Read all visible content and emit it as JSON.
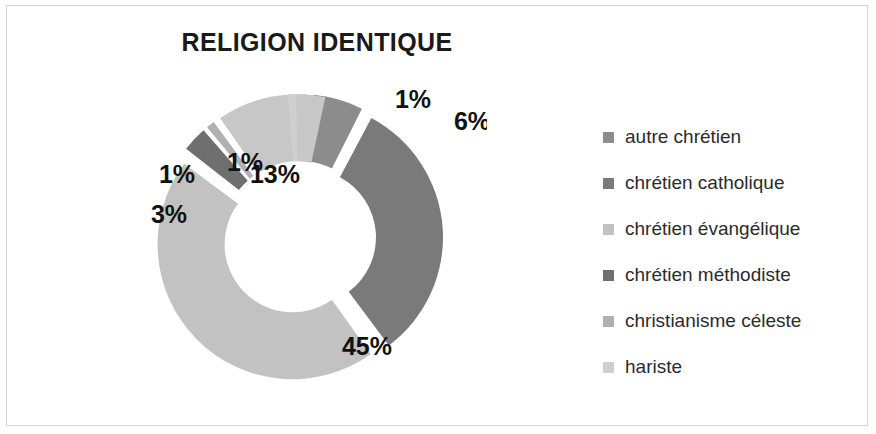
{
  "chart_title": "RELIGION IDENTIQUE",
  "legend": {
    "items": [
      {
        "label": "autre chrétien",
        "color": "#8c8c8c"
      },
      {
        "label": "chrétien catholique",
        "color": "#7a7a7a"
      },
      {
        "label": "chrétien évangélique",
        "color": "#c2c2c2"
      },
      {
        "label": "chrétien méthodiste",
        "color": "#6f6f6f"
      },
      {
        "label": "christianisme céleste",
        "color": "#b0b0b0"
      },
      {
        "label": "hariste",
        "color": "#cfcfcf"
      }
    ]
  },
  "chart_data": {
    "type": "pie",
    "variant": "doughnut-exploded",
    "title": "RELIGION IDENTIQUE",
    "xlabel": "",
    "ylabel": "",
    "legend_position": "right",
    "grid": false,
    "unit": "%",
    "categories": [
      "autre chrétien",
      "chrétien catholique",
      "chrétien évangélique",
      "chrétien méthodiste",
      "christianisme céleste",
      "hariste"
    ],
    "values": [
      6,
      32,
      45,
      3,
      1,
      1
    ],
    "data_labels": [
      "6%",
      "32%",
      "45%",
      "3%",
      "1%",
      "1%"
    ],
    "extra_slices": [
      {
        "label": "13%",
        "value": 13,
        "color": "#c7c7c7"
      },
      {
        "label": "1%",
        "value": 1,
        "color": "#cfcfcf"
      }
    ],
    "colors": [
      "#8c8c8c",
      "#7a7a7a",
      "#c2c2c2",
      "#6f6f6f",
      "#b0b0b0",
      "#cfcfcf"
    ],
    "slices": [
      {
        "label": "1%",
        "value": 1,
        "color": "#cfcfcf",
        "start": 0,
        "end": 3.6,
        "lx": 286,
        "ly": 25
      },
      {
        "label": "6%",
        "value": 6,
        "color": "#8c8c8c",
        "start": 5.0,
        "end": 26.6,
        "lx": 345,
        "ly": 47
      },
      {
        "label": "32%",
        "value": 32,
        "color": "#7a7a7a",
        "start": 28.0,
        "end": 143.2,
        "lx": 404,
        "ly": 172
      },
      {
        "label": "45%",
        "value": 45,
        "color": "#c2c2c2",
        "start": 144.6,
        "end": 306.6,
        "lx": 240,
        "ly": 272
      },
      {
        "label": "3%",
        "value": 3,
        "color": "#6f6f6f",
        "start": 308.0,
        "end": 318.8,
        "lx": 42,
        "ly": 140
      },
      {
        "label": "1%",
        "value": 1,
        "color": "#b0b0b0",
        "start": 320.2,
        "end": 323.8,
        "lx": 50,
        "ly": 100
      },
      {
        "label": "13%",
        "value": 13,
        "color": "#c7c7c7",
        "start": 325.2,
        "end": 372.0,
        "lx": 148,
        "ly": 100
      },
      {
        "label": "1%",
        "value": 1,
        "color": "#cfcfcf",
        "start": 355.4,
        "end": 359.0,
        "lx": 118,
        "ly": 88
      }
    ]
  }
}
